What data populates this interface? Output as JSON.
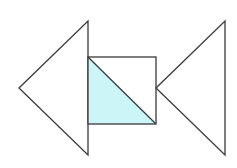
{
  "diagram": {
    "colors": {
      "stroke": "#3a3a3a",
      "fill_shaded": "#ccf5f8",
      "background": "#ffffff"
    },
    "shapes": {
      "left_triangle": {
        "points": "19,88 88,21 88,155"
      },
      "square": {
        "x": 88,
        "y": 57,
        "width": 68,
        "height": 67
      },
      "shaded_triangle": {
        "points": "88,57 156,124 88,124"
      },
      "diagonal": {
        "x1": 88,
        "y1": 57,
        "x2": 156,
        "y2": 124
      },
      "right_triangle": {
        "points": "156,88 225,21 225,155"
      }
    }
  }
}
